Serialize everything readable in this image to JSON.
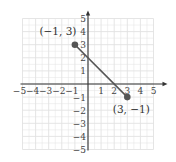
{
  "chart_data": {
    "type": "line",
    "title": "",
    "xlabel": "",
    "ylabel": "",
    "xlim": [
      -5,
      5
    ],
    "ylim": [
      -5,
      5
    ],
    "grid": true,
    "x_ticks": [
      -5,
      -4,
      -3,
      -2,
      -1,
      1,
      2,
      3,
      4,
      5
    ],
    "y_ticks": [
      -5,
      -4,
      -3,
      -2,
      -1,
      1,
      2,
      3,
      4,
      5
    ],
    "x_tick_labels": [
      "−5",
      "−4",
      "−3",
      "−2",
      "−1",
      "1",
      "2",
      "3",
      "4",
      "5"
    ],
    "y_tick_labels": [
      "−5",
      "−4",
      "−3",
      "−2",
      "−1",
      "1",
      "2",
      "3",
      "4",
      "5"
    ],
    "series": [
      {
        "name": "segment",
        "points": [
          {
            "x": -1,
            "y": 3,
            "label": "(−1, 3)"
          },
          {
            "x": 3,
            "y": -1,
            "label": "(3, −1)"
          }
        ]
      }
    ],
    "colors": {
      "grid": "#e2e2e2",
      "axis": "#333333",
      "line": "#555555",
      "point": "#555555"
    }
  }
}
